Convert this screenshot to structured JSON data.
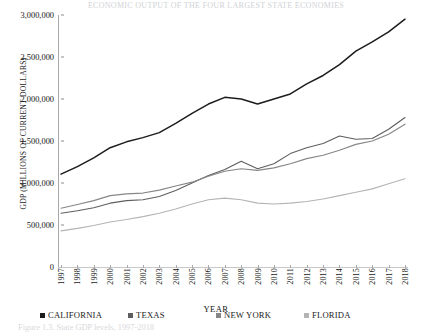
{
  "figure": {
    "top_cut_text": "ECONOMIC OUTPUT OF THE FOUR LARGEST STATE ECONOMIES",
    "caption": "Figure 1.3. State GDP levels, 1997-2018"
  },
  "legend": {
    "position": "bottom",
    "items": [
      {
        "label": "CALIFORNIA",
        "color": "#1c1c1c"
      },
      {
        "label": "TEXAS",
        "color": "#5e5e5e"
      },
      {
        "label": "NEW YORK",
        "color": "#868686"
      },
      {
        "label": "FLORIDA",
        "color": "#b4b4b4"
      }
    ]
  },
  "chart_data": {
    "type": "line",
    "title": "",
    "xlabel": "YEAR",
    "ylabel": "GDP (MILLIONS OF CURRENT DOLLARS)",
    "x": [
      1997,
      1998,
      1999,
      2000,
      2001,
      2002,
      2003,
      2004,
      2005,
      2006,
      2007,
      2008,
      2009,
      2010,
      2011,
      2012,
      2013,
      2014,
      2015,
      2016,
      2017,
      2018
    ],
    "categories": [
      "1997",
      "1998",
      "1999",
      "2000",
      "2001",
      "2002",
      "2003",
      "2004",
      "2005",
      "2006",
      "2007",
      "2008",
      "2009",
      "2010",
      "2011",
      "2012",
      "2013",
      "2014",
      "2015",
      "2016",
      "2017",
      "2018"
    ],
    "ylim": [
      0,
      3000000
    ],
    "yticks": [
      0,
      500000,
      1000000,
      1500000,
      2000000,
      2500000,
      3000000
    ],
    "ytick_labels": [
      "0",
      "500,000",
      "1,000,000",
      "1,500,000",
      "2,000,000",
      "2,500,000",
      "3,000,000"
    ],
    "grid": false,
    "series": [
      {
        "name": "CALIFORNIA",
        "color": "#1c1c1c",
        "width": 1.5,
        "values": [
          1105000,
          1195000,
          1300000,
          1420000,
          1490000,
          1540000,
          1600000,
          1710000,
          1830000,
          1940000,
          2020000,
          2000000,
          1940000,
          2000000,
          2060000,
          2180000,
          2280000,
          2410000,
          2570000,
          2680000,
          2800000,
          2950000
        ]
      },
      {
        "name": "TEXAS",
        "color": "#5e5e5e",
        "width": 1.1,
        "values": [
          640000,
          670000,
          705000,
          760000,
          790000,
          800000,
          840000,
          910000,
          1000000,
          1090000,
          1160000,
          1260000,
          1170000,
          1230000,
          1350000,
          1420000,
          1470000,
          1560000,
          1520000,
          1530000,
          1640000,
          1780000
        ]
      },
      {
        "name": "NEW YORK",
        "color": "#868686",
        "width": 1.1,
        "values": [
          700000,
          745000,
          790000,
          850000,
          870000,
          880000,
          915000,
          965000,
          1010000,
          1080000,
          1140000,
          1170000,
          1150000,
          1180000,
          1230000,
          1290000,
          1330000,
          1390000,
          1460000,
          1500000,
          1580000,
          1700000
        ]
      },
      {
        "name": "FLORIDA",
        "color": "#b4b4b4",
        "width": 1.1,
        "values": [
          430000,
          460000,
          495000,
          535000,
          565000,
          600000,
          640000,
          690000,
          750000,
          800000,
          820000,
          800000,
          760000,
          750000,
          760000,
          780000,
          810000,
          850000,
          890000,
          930000,
          990000,
          1050000
        ]
      }
    ]
  }
}
